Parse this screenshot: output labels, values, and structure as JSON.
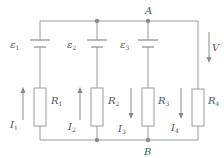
{
  "diagram": {
    "type": "circuit",
    "nodes": {
      "A": {
        "label": "A"
      },
      "B": {
        "label": "B"
      }
    },
    "emfs": [
      {
        "symbol": "ε",
        "sub": "1"
      },
      {
        "symbol": "ε",
        "sub": "2"
      },
      {
        "symbol": "ε",
        "sub": "3"
      }
    ],
    "resistors": [
      {
        "symbol": "R",
        "sub": "1"
      },
      {
        "symbol": "R",
        "sub": "2"
      },
      {
        "symbol": "R",
        "sub": "3"
      },
      {
        "symbol": "R",
        "sub": "4"
      }
    ],
    "currents": [
      {
        "symbol": "I",
        "sub": "1",
        "direction": "up"
      },
      {
        "symbol": "I",
        "sub": "2",
        "direction": "up"
      },
      {
        "symbol": "I",
        "sub": "3",
        "direction": "down"
      },
      {
        "symbol": "I",
        "sub": "4",
        "direction": "down"
      }
    ],
    "voltage": {
      "symbol": "V",
      "direction": "down"
    },
    "colors": {
      "wire": "#9a9a9a",
      "text": "#555555",
      "node": "#8c8c8c"
    }
  }
}
